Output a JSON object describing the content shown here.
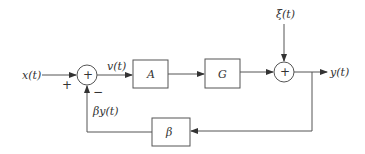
{
  "diagram": {
    "type": "feedback-block-diagram",
    "colors": {
      "line": "#555555",
      "text": "#333333",
      "background": "#ffffff"
    },
    "input": {
      "label": "x(t)",
      "sign": "+"
    },
    "summer1": {
      "symbol": "+",
      "feedback_sign": "−"
    },
    "signal_v": {
      "label": "v(t)"
    },
    "block_a": {
      "label": "A"
    },
    "block_g": {
      "label": "G"
    },
    "disturbance": {
      "label": "ξ(t)"
    },
    "summer2": {
      "symbol": "+"
    },
    "output": {
      "label": "y(t)"
    },
    "feedback_block": {
      "label": "β"
    },
    "feedback_signal": {
      "label": "βy(t)"
    }
  }
}
